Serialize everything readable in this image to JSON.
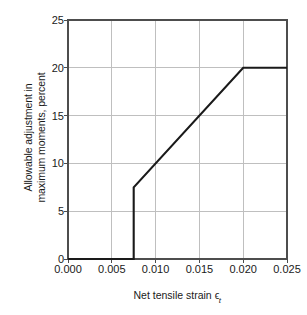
{
  "chart_data": {
    "type": "line",
    "title": "",
    "xlabel": "Net tensile strain",
    "xlabel_symbol": "ϵ",
    "xlabel_subscript": "t",
    "ylabel_line1": "Allowable adjustment in",
    "ylabel_line2": "maximum moments, percent",
    "xlim": [
      0.0,
      0.025
    ],
    "ylim": [
      0,
      25
    ],
    "xticks": [
      0.0,
      0.005,
      0.01,
      0.015,
      0.02,
      0.025
    ],
    "xtick_labels": [
      "0.000",
      "0.005",
      "0.010",
      "0.015",
      "0.020",
      "0.025"
    ],
    "yticks": [
      0,
      5,
      10,
      15,
      20,
      25
    ],
    "ytick_labels": [
      "0",
      "5",
      "10",
      "15",
      "20",
      "25"
    ],
    "grid": true,
    "legend": "none",
    "series": [
      {
        "name": "Allowable moment redistribution",
        "color": "#1a1a1a",
        "x": [
          0.0,
          0.0075,
          0.0075,
          0.02,
          0.025
        ],
        "values": [
          0,
          0,
          7.5,
          20,
          20
        ]
      }
    ],
    "annotations": []
  },
  "style": {
    "background": "#ffffff",
    "axis_color": "#4d4d4d",
    "grid_color": "#bfbfbf",
    "line_color": "#1a1a1a",
    "text_color": "#1a1a1a"
  }
}
